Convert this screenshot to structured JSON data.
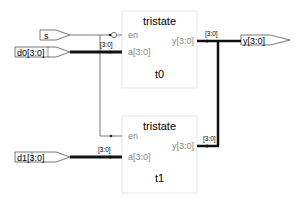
{
  "diagram": {
    "type": "rtl-schematic",
    "inputs": [
      {
        "name": "s",
        "label": "s"
      },
      {
        "name": "d0",
        "label": "d0[3:0]"
      },
      {
        "name": "d1",
        "label": "d1[3:0]"
      }
    ],
    "outputs": [
      {
        "name": "y",
        "label": "y[3:0]"
      }
    ],
    "instances": [
      {
        "name": "t0",
        "module": "tristate",
        "pins": {
          "en": "en",
          "a": "a[3:0]",
          "y": "y[3:0]"
        },
        "en_inverted": true
      },
      {
        "name": "t1",
        "module": "tristate",
        "pins": {
          "en": "en",
          "a": "a[3:0]",
          "y": "y[3:0]"
        },
        "en_inverted": false
      }
    ],
    "bus_labels": {
      "d0_to_t0": "[3:0]",
      "d1_to_t1": "[3:0]",
      "t0_out": "[3:0]",
      "t1_out": "[3:0]"
    }
  }
}
